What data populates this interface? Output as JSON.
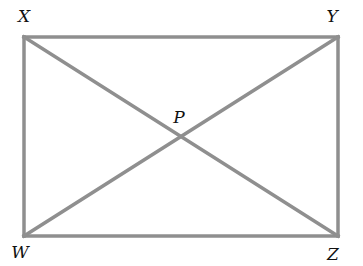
{
  "diagram": {
    "type": "rectangle-with-diagonals",
    "line_color": "#8f8f8f",
    "points": [
      {
        "name": "X",
        "x": 24,
        "y": 37,
        "label_x": 24,
        "label_y": 22
      },
      {
        "name": "Y",
        "x": 338,
        "y": 37,
        "label_x": 332,
        "label_y": 22
      },
      {
        "name": "W",
        "x": 24,
        "y": 236,
        "label_x": 20,
        "label_y": 258
      },
      {
        "name": "Z",
        "x": 338,
        "y": 236,
        "label_x": 333,
        "label_y": 260
      },
      {
        "name": "P",
        "x": 181,
        "y": 137,
        "label_x": 179,
        "label_y": 123
      }
    ],
    "segments": [
      [
        "X",
        "Y"
      ],
      [
        "Y",
        "Z"
      ],
      [
        "Z",
        "W"
      ],
      [
        "W",
        "X"
      ],
      [
        "X",
        "Z"
      ],
      [
        "W",
        "Y"
      ]
    ]
  }
}
